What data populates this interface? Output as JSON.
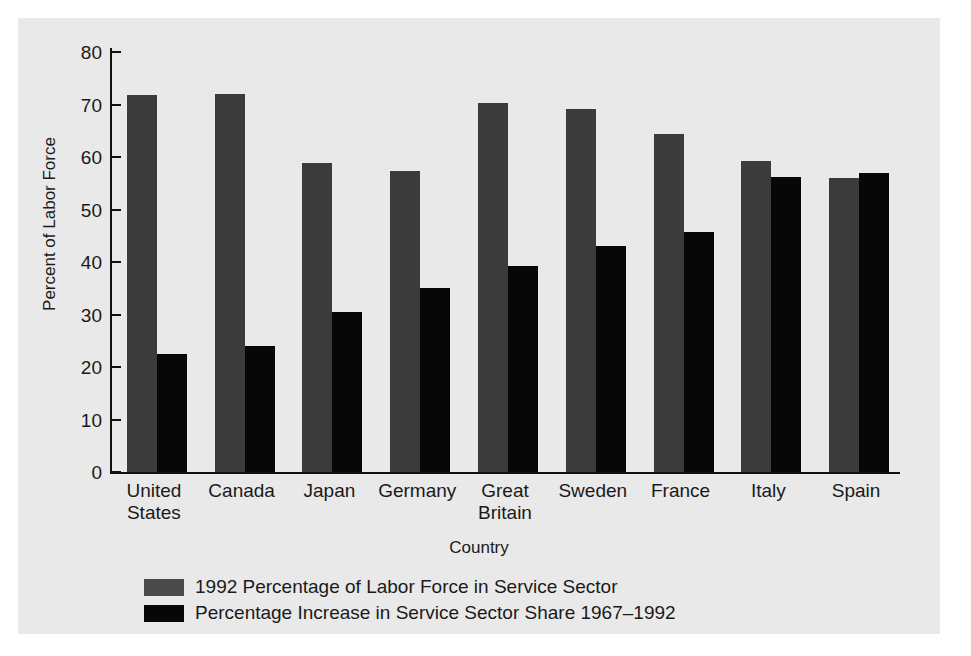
{
  "chart_data": {
    "type": "bar",
    "title": "",
    "xlabel": "Country",
    "ylabel": "Percent of Labor Force",
    "ylim": [
      0,
      80
    ],
    "yticks": [
      0,
      10,
      20,
      30,
      40,
      50,
      60,
      70,
      80
    ],
    "ytick_labels": [
      "0",
      "10",
      "20",
      "30",
      "40",
      "50",
      "60",
      "70",
      "80"
    ],
    "grid": false,
    "legend_position": "below-axes-left",
    "categories": [
      "United\nStates",
      "Canada",
      "Japan",
      "Germany",
      "Great\nBritain",
      "Sweden",
      "France",
      "Italy",
      "Spain"
    ],
    "series": [
      {
        "name": "1992 Percentage of Labor Force in Service Sector",
        "color": "#3b3b3b",
        "values": [
          71.8,
          72.0,
          58.8,
          57.4,
          70.2,
          69.2,
          64.4,
          59.2,
          56.0
        ]
      },
      {
        "name": "Percentage Increase in Service Sector Share 1967–1992",
        "color": "#070707",
        "values": [
          22.4,
          24.0,
          30.4,
          35.0,
          39.2,
          43.0,
          45.8,
          56.2,
          57.0
        ]
      }
    ]
  },
  "colors": {
    "figure_background": "#e9e9e9",
    "page_background": "#ffffff",
    "axis": "#111111",
    "text": "#1a1a1a",
    "series1": "#3b3b3b",
    "series2": "#070707"
  }
}
